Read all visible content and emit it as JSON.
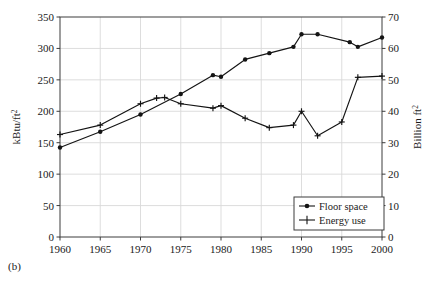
{
  "figure": {
    "caption": "(b)"
  },
  "chart_data": {
    "type": "line",
    "title": "",
    "xlabel": "",
    "grid": true,
    "legend_position": "bottom-right",
    "xlim": [
      1960,
      2000
    ],
    "xticks": [
      1960,
      1965,
      1970,
      1975,
      1980,
      1985,
      1990,
      1995,
      2000
    ],
    "xtick_labels": [
      "1960",
      "1965",
      "1970",
      "1975",
      "1980",
      "1985",
      "1990",
      "1995",
      "2000"
    ],
    "left_axis": {
      "label": "kBtu/ft",
      "label_sup": "2",
      "ylim": [
        0,
        350
      ],
      "yticks": [
        0,
        50,
        100,
        150,
        200,
        250,
        300,
        350
      ],
      "ytick_labels": [
        "0",
        "50",
        "100",
        "150",
        "200",
        "250",
        "300",
        "350"
      ]
    },
    "right_axis": {
      "label": "Billion ft",
      "label_sup": "2",
      "ylim": [
        0,
        70
      ],
      "yticks": [
        0,
        10,
        20,
        30,
        40,
        50,
        60,
        70
      ],
      "ytick_labels": [
        "0",
        "10",
        "20",
        "30",
        "40",
        "50",
        "60",
        "70"
      ]
    },
    "series": [
      {
        "name": "Floor space",
        "axis": "right",
        "units": "Billion ft2",
        "marker": "filled-circle",
        "color": "#141414",
        "x": [
          1960,
          1965,
          1970,
          1975,
          1979,
          1980,
          1983,
          1986,
          1989,
          1990,
          1992,
          1996,
          1997,
          2000
        ],
        "y": [
          28.5,
          33.5,
          39.0,
          45.5,
          51.5,
          51.0,
          56.5,
          58.5,
          60.5,
          64.5,
          64.5,
          62.0,
          60.5,
          63.5
        ]
      },
      {
        "name": "Energy use",
        "axis": "left",
        "units": "kBtu/ft2",
        "marker": "plus",
        "color": "#141414",
        "x": [
          1960,
          1965,
          1970,
          1972,
          1973,
          1975,
          1979,
          1980,
          1983,
          1986,
          1989,
          1990,
          1992,
          1995,
          1997,
          2000
        ],
        "y": [
          163,
          178,
          212,
          221,
          222,
          212,
          205,
          209,
          189,
          174,
          178,
          200,
          161,
          183,
          254,
          256
        ]
      }
    ],
    "legend": [
      {
        "label": "Floor space",
        "marker": "filled-circle"
      },
      {
        "label": "Energy use",
        "marker": "plus"
      }
    ],
    "colors": {
      "grid": "#d9d9d9",
      "axis": "#3c3c3c",
      "line": "#141414",
      "background": "#ffffff"
    }
  }
}
